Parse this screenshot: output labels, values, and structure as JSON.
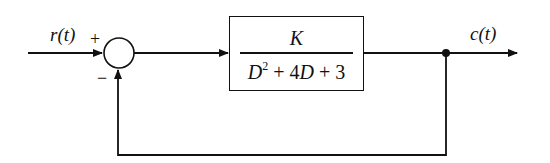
{
  "diagram": {
    "type": "feedback-control-block-diagram",
    "input": {
      "label": "r(t)"
    },
    "output": {
      "label": "c(t)"
    },
    "summing_junction": {
      "plus_sign": "+",
      "minus_sign": "−"
    },
    "plant": {
      "numerator": "K",
      "denominator_parts": {
        "d": "D",
        "exp": "2",
        "rest_a": " + 4",
        "d2": "D",
        "rest_b": " + 3"
      },
      "transfer_function": "K / (D^2 + 4D + 3)"
    },
    "feedback": "unity negative feedback",
    "colors": {
      "line": "#111111",
      "background": "#ffffff"
    }
  }
}
